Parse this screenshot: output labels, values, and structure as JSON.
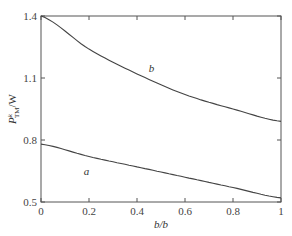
{
  "chart_data": {
    "type": "line",
    "title": "",
    "xlabel": "b/b",
    "ylabel": "P",
    "ylabel_sup": "k",
    "ylabel_sub": "TM",
    "ylabel_unit": "/W",
    "xlim": [
      0,
      1
    ],
    "ylim": [
      0.5,
      1.4
    ],
    "x_ticks": [
      0,
      0.2,
      0.4,
      0.6,
      0.8,
      1
    ],
    "x_tick_labels": [
      "0",
      "0.2",
      "0.4",
      "0.6",
      "0.8",
      "1"
    ],
    "y_ticks": [
      0.5,
      0.8,
      1.1,
      1.4
    ],
    "y_tick_labels": [
      "0.5",
      "0.8",
      "1.1",
      "1.4"
    ],
    "grid": false,
    "legend": "none (inline curve labels)",
    "x": [
      0,
      0.2,
      0.4,
      0.6,
      0.8,
      1.0
    ],
    "series": [
      {
        "name": "a",
        "values": [
          0.78,
          0.72,
          0.67,
          0.62,
          0.57,
          0.52
        ],
        "label_pos": [
          0.19,
          0.63
        ]
      },
      {
        "name": "b",
        "values": [
          1.4,
          1.24,
          1.12,
          1.02,
          0.95,
          0.89
        ],
        "label_pos": [
          0.46,
          1.13
        ]
      }
    ]
  }
}
